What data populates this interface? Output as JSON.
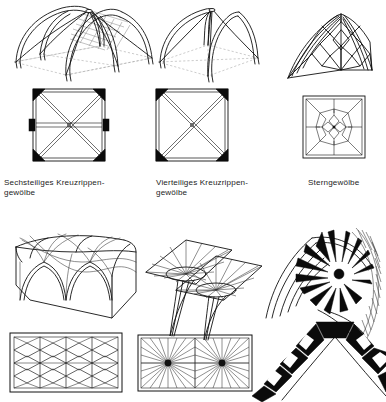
{
  "plate": {
    "title": "Gewölbeformen",
    "background_color": "#ffffff",
    "ink_color": "#111111",
    "style": "black line engraving, architectural lexicon plate",
    "width": 386,
    "height": 402,
    "rows": 2,
    "columns": 3
  },
  "captions": [
    {
      "id": "caption-sechsteiliges",
      "line1": "Sechsteiliges Kreuzrippen-",
      "line2": "gewölbe",
      "text": "Sechsteiliges Kreuzrippen-\ngewölbe"
    },
    {
      "id": "caption-vierteiliges",
      "line1": "Vierteiliges Kreuzrippen-",
      "line2": "gewölbe",
      "text": "Vierteiliges Kreuzrippen-\ngewölbe"
    },
    {
      "id": "caption-sterngewoelbe",
      "line1": "Sterngewölbe",
      "line2": "",
      "text": "Sterngewölbe"
    }
  ],
  "figures": [
    {
      "id": "fig-sechsteiliges-perspektive",
      "name": "Sechsteiliges Kreuzrippengewölbe — Perspektive",
      "view": "perspective",
      "row": 1,
      "column": 1,
      "description": "Sechsteiliges Kreuzrippengewölbe in Schrägansicht mit Spitzbögen, Gratrippen und schraffierter Kappe"
    },
    {
      "id": "fig-sechsteiliges-grundriss",
      "name": "Sechsteiliges Kreuzrippengewölbe — Grundriss",
      "view": "plan",
      "row": 1,
      "column": 1,
      "ribs": "Diagonalkreuz mit zusätzlicher Quergurtrippe",
      "piers": 6,
      "description": "Quadratischer Grundriss, Diagonalrippen über Eck, mittlerer Quergurt, sechs schwarze Dienste"
    },
    {
      "id": "fig-vierteiliges-perspektive",
      "name": "Vierteiliges Kreuzrippengewölbe — Perspektive",
      "view": "perspective",
      "row": 1,
      "column": 2,
      "description": "Vierteiliges Kreuzrippengewölbe in Schrägansicht mit vier Spitzbögen und Diagonalrippen"
    },
    {
      "id": "fig-vierteiliges-grundriss",
      "name": "Vierteiliges Kreuzrippengewölbe — Grundriss",
      "view": "plan",
      "row": 1,
      "column": 2,
      "ribs": "Diagonalkreuz",
      "piers": 4,
      "description": "Quadratischer Grundriss mit Diagonalkreuz und vier schwarzen Eckdiensten"
    },
    {
      "id": "fig-sterngewoelbe-perspektive",
      "name": "Sterngewölbe — Perspektive",
      "view": "perspective",
      "row": 1,
      "column": 3,
      "description": "Sterngewölbe in Schrägansicht mit sternförmig angeordneten Nebenrippen"
    },
    {
      "id": "fig-sterngewoelbe-grundriss",
      "name": "Sterngewölbe — Grundriss",
      "view": "plan",
      "row": 1,
      "column": 3,
      "ribs": "Sternfigur mit Rosette im Scheitel",
      "description": "Quadratischer Grundriss mit achtstrahliger Sternfigur und zentraler Rosette"
    },
    {
      "id": "fig-netzgewoelbe-perspektive",
      "name": "Netzgewölbe — Perspektive",
      "view": "perspective",
      "row": 2,
      "column": 1,
      "description": "Tonnenartiges Netzgewölbe über Rechteckraum mit durchlaufendem Rautennetz"
    },
    {
      "id": "fig-netzgewoelbe-grundriss",
      "name": "Netzgewölbe — Grundriss",
      "view": "plan",
      "row": 2,
      "column": 1,
      "ribs": "Rautennetz mit Quergurten",
      "description": "Rechteckiger Grundriss mit fortlaufendem Rautennetz und drei Quergurten"
    },
    {
      "id": "fig-faechergewoelbe-perspektive",
      "name": "Fächergewölbe — Perspektive",
      "view": "perspective",
      "row": 2,
      "column": 2,
      "description": "Fächergewölbe mit zwei Trichterkegeln auf schlanken Stützen, Rippen strahlen radial aus"
    },
    {
      "id": "fig-faechergewoelbe-grundriss",
      "name": "Fächergewölbe — Grundriss",
      "view": "plan",
      "row": 2,
      "column": 2,
      "ribs": "radial strahlende Fächerrippen",
      "fan_centres": 2,
      "description": "Rechteckiger Grundriss mit zwei Fächerzentren, von denen Rippen radial auslaufen"
    },
    {
      "id": "fig-gewoelbedetail-perspektive",
      "name": "Gewölbedetail — Ausschnitt",
      "view": "detail",
      "row": 2,
      "column": 3,
      "description": "Ausschnitt eines Gewölbezwickels in starker Schwarz-Weiß-Zeichnung mit Rippenstern und Kappenlagen"
    },
    {
      "id": "fig-spitzbogen-schnitt",
      "name": "Spitzbogen — Schnitt",
      "view": "section",
      "row": 2,
      "column": 3,
      "description": "Schnitt durch einen Spitzbogen aus Keilsteinen mit Schlussstein im Scheitel",
      "keystone": "Schlussstein"
    }
  ]
}
